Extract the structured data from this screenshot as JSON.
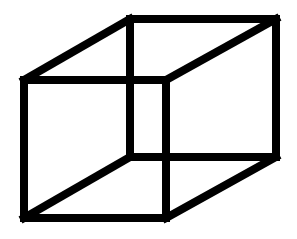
{
  "figure": {
    "background": "#ffffff",
    "stroke_color": "#000000",
    "stroke_width": 8,
    "vertices": {
      "front_top_left": [
        24,
        80
      ],
      "front_top_right": [
        166,
        80
      ],
      "front_bottom_left": [
        24,
        218
      ],
      "front_bottom_right": [
        166,
        218
      ],
      "back_top_left": [
        130,
        19
      ],
      "back_top_right": [
        276,
        19
      ],
      "back_bottom_left": [
        130,
        157
      ],
      "back_bottom_right": [
        276,
        157
      ]
    },
    "edges": [
      {
        "name": "front-top-edge",
        "from": "front_top_left",
        "to": "front_top_right"
      },
      {
        "name": "front-bottom-edge",
        "from": "front_bottom_left",
        "to": "front_bottom_right"
      },
      {
        "name": "front-left-edge",
        "from": "front_top_left",
        "to": "front_bottom_left"
      },
      {
        "name": "front-right-edge",
        "from": "front_top_right",
        "to": "front_bottom_right"
      },
      {
        "name": "back-top-edge",
        "from": "back_top_left",
        "to": "back_top_right"
      },
      {
        "name": "back-bottom-edge",
        "from": "back_bottom_left",
        "to": "back_bottom_right"
      },
      {
        "name": "back-left-edge",
        "from": "back_top_left",
        "to": "back_bottom_left"
      },
      {
        "name": "back-right-edge",
        "from": "back_top_right",
        "to": "back_bottom_right"
      },
      {
        "name": "top-left-connector-edge",
        "from": "front_top_left",
        "to": "back_top_left"
      },
      {
        "name": "top-right-connector-edge",
        "from": "front_top_right",
        "to": "back_top_right"
      },
      {
        "name": "bottom-left-connector-edge",
        "from": "front_bottom_left",
        "to": "back_bottom_left"
      },
      {
        "name": "bottom-right-connector-edge",
        "from": "front_bottom_right",
        "to": "back_bottom_right"
      }
    ]
  }
}
